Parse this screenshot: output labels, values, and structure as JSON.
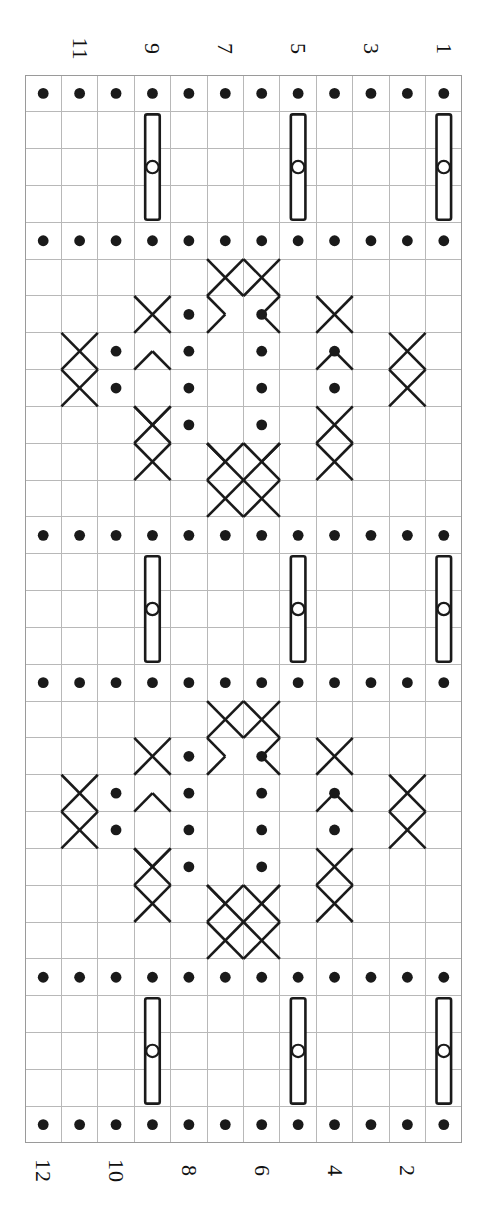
{
  "document": {
    "type": "knitting-stitch-chart",
    "orientation": "rotated-90",
    "background_color": "#ffffff",
    "ink_color": "#1a1a1a",
    "grid_line_color": "#b8b8b8"
  },
  "grid": {
    "columns": 12,
    "rows": 29,
    "cell_width": 36.42,
    "cell_height": 36.83,
    "origin_x": 25,
    "origin_y": 75,
    "width": 437,
    "height": 1068,
    "line_color": "#b8b8b8",
    "line_width": 1,
    "border_color": "#9a9a9a"
  },
  "axis_labels": {
    "top_row": [
      {
        "text": "11",
        "column": 10
      },
      {
        "text": "9",
        "column": 8
      },
      {
        "text": "7",
        "column": 6
      },
      {
        "text": "5",
        "column": 4
      },
      {
        "text": "3",
        "column": 2
      },
      {
        "text": "1",
        "column": 0
      }
    ],
    "bottom_row": [
      {
        "text": "12",
        "column": 11
      },
      {
        "text": "10",
        "column": 9
      },
      {
        "text": "8",
        "column": 7
      },
      {
        "text": "6",
        "column": 5
      },
      {
        "text": "4",
        "column": 3
      },
      {
        "text": "2",
        "column": 1
      }
    ]
  },
  "legend": {
    "purl_dot": "filled-dot",
    "bobble": "rounded-rectangle-with-open-circle",
    "cable_cross": "diagonal-x-crossing"
  },
  "chart_data": {
    "type": "table",
    "title": "",
    "columns": 12,
    "rows": 29,
    "symbols": {
      "dot": "purl stitch (filled dot)",
      "bobble": "make bobble (tall rounded rectangle enclosing a small open circle, spans 3 rows)",
      "cable": "cable cross (diagonal line segments crossing)"
    },
    "dot_rows": [
      0,
      4,
      12,
      16,
      24,
      28
    ],
    "bobble_cells": [
      {
        "row_start": 1,
        "row_span": 3,
        "column": 0
      },
      {
        "row_start": 1,
        "row_span": 3,
        "column": 4
      },
      {
        "row_start": 1,
        "row_span": 3,
        "column": 8
      },
      {
        "row_start": 13,
        "row_span": 3,
        "column": 0
      },
      {
        "row_start": 13,
        "row_span": 3,
        "column": 4
      },
      {
        "row_start": 13,
        "row_span": 3,
        "column": 8
      },
      {
        "row_start": 25,
        "row_span": 3,
        "column": 0
      },
      {
        "row_start": 25,
        "row_span": 3,
        "column": 4
      },
      {
        "row_start": 25,
        "row_span": 3,
        "column": 8
      }
    ],
    "motif_blocks": [
      {
        "name": "diamond-panel-1",
        "row_start": 5,
        "row_end": 11
      },
      {
        "name": "diamond-panel-2",
        "row_start": 17,
        "row_end": 23
      }
    ],
    "panel_dots": [
      {
        "row_offset": 1,
        "columns": [
          5,
          7
        ]
      },
      {
        "row_offset": 2,
        "columns": [
          3,
          5,
          7,
          9
        ]
      },
      {
        "row_offset": 3,
        "columns": [
          3,
          5,
          7,
          9
        ]
      },
      {
        "row_offset": 4,
        "columns": [
          5,
          7
        ]
      }
    ],
    "panel_cables": [
      {
        "row_offset": 0,
        "col": 5,
        "shape": "x"
      },
      {
        "row_offset": 0,
        "col": 6,
        "shape": "x"
      },
      {
        "row_offset": 1,
        "col": 3,
        "shape": "x"
      },
      {
        "row_offset": 1,
        "col": 8,
        "shape": "x"
      },
      {
        "row_offset": 2,
        "col": 1,
        "shape": "x"
      },
      {
        "row_offset": 2,
        "col": 10,
        "shape": "x"
      },
      {
        "row_offset": 4,
        "col": 3,
        "shape": "x"
      },
      {
        "row_offset": 4,
        "col": 8,
        "shape": "x"
      },
      {
        "row_offset": 5,
        "col": 5,
        "shape": "x"
      },
      {
        "row_offset": 5,
        "col": 6,
        "shape": "x"
      }
    ]
  }
}
